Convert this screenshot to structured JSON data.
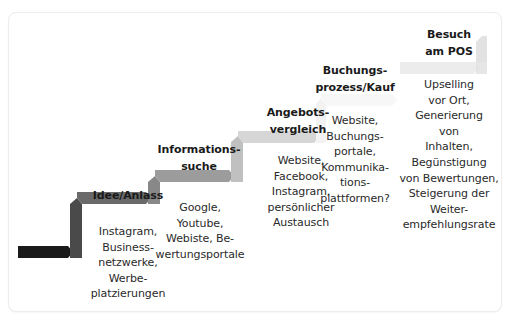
{
  "diagram": {
    "type": "customer-journey-staircase",
    "steps": [
      {
        "title_lines": [
          "Idee/Anlass"
        ],
        "body_lines": [
          "Instagram,",
          "Business-",
          "netzwerke,",
          "Werbe-",
          "platzierungen"
        ],
        "color": "#6a6a6a"
      },
      {
        "title_lines": [
          "Informations-",
          "suche"
        ],
        "body_lines": [
          "Google,",
          "Youtube,",
          "Webiste, Be-",
          "wertungsportale"
        ],
        "color": "#9a9a9a"
      },
      {
        "title_lines": [
          "Angebots-",
          "vergleich"
        ],
        "body_lines": [
          "Website,",
          "Facebook,",
          "Instagram,",
          "persönlicher",
          "Austausch"
        ],
        "color": "#c8c8c8"
      },
      {
        "title_lines": [
          "Buchungs-",
          "prozess/Kauf"
        ],
        "body_lines": [
          "Website,",
          "Buchungs-",
          "portale,",
          "Kommunika-",
          "tions-",
          "plattformen?"
        ],
        "color": "#f6f6f6"
      },
      {
        "title_lines": [
          "Besuch",
          "am POS"
        ],
        "body_lines": [
          "Upselling",
          "vor Ort,",
          "Generierung",
          "von",
          "Inhalten,",
          "Begünstigung",
          "von Bewertungen,",
          "Steigerung der",
          "Weiter-",
          "empfehlungsrate"
        ],
        "color": "#e6e6e6"
      }
    ],
    "start_color": "#1a1a1a"
  }
}
